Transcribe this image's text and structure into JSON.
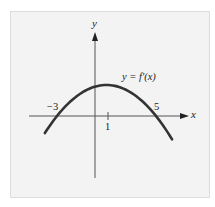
{
  "chart_data": {
    "type": "line",
    "title": "",
    "xlabel": "x",
    "ylabel": "y",
    "curve_label": "y = f′(x)",
    "function": "f'(x) downward-opening parabola with roots at x = -3 and x = 5, vertex at x = 1",
    "x_ticks": [
      {
        "value": -3,
        "label": "−3"
      },
      {
        "value": 1,
        "label": "1"
      },
      {
        "value": 5,
        "label": "5"
      }
    ],
    "roots": [
      -3,
      5
    ],
    "vertex_x": 1,
    "x_range": [
      -4,
      6.5
    ],
    "series": [
      {
        "name": "y = f′(x)",
        "x": [
          -4,
          -3,
          -2,
          -1,
          0,
          1,
          2,
          3,
          4,
          5,
          6
        ],
        "y": [
          -1.1,
          0,
          0.9,
          1.5,
          1.9,
          2.0,
          1.9,
          1.5,
          0.9,
          0,
          -1.1
        ]
      }
    ],
    "grid": false,
    "legend": "none",
    "colors": {
      "curve": "#333333",
      "axes": "#555555",
      "background": "#f3f3f3"
    }
  },
  "labels": {
    "y_axis": "y",
    "x_axis": "x",
    "curve_prefix": "y = ",
    "curve_func": "f′(x)",
    "tick_neg3": "−3",
    "tick_1": "1",
    "tick_5": "5"
  }
}
